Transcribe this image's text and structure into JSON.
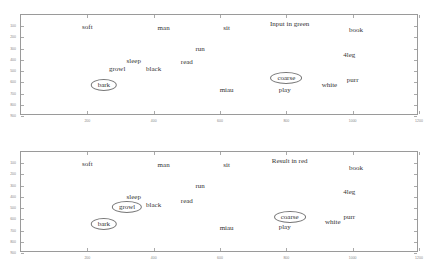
{
  "chart_data": [
    {
      "type": "scatter",
      "title": "Input in green",
      "xlabel": "",
      "ylabel": "",
      "xlim": [
        0,
        1200
      ],
      "ylim": [
        900,
        0
      ],
      "x_ticks": [
        200,
        400,
        600,
        800,
        1000,
        1200
      ],
      "y_ticks": [
        100,
        200,
        300,
        400,
        500,
        600,
        700,
        800,
        900
      ],
      "grid": false,
      "points": [
        {
          "label": "soft",
          "x": 200,
          "y": 110,
          "circled": false
        },
        {
          "label": "man",
          "x": 430,
          "y": 120,
          "circled": false
        },
        {
          "label": "sit",
          "x": 620,
          "y": 120,
          "circled": false
        },
        {
          "label": "book",
          "x": 1010,
          "y": 135,
          "circled": false
        },
        {
          "label": "run",
          "x": 540,
          "y": 300,
          "circled": false
        },
        {
          "label": "4leg",
          "x": 990,
          "y": 355,
          "circled": false
        },
        {
          "label": "sleep",
          "x": 340,
          "y": 410,
          "circled": false
        },
        {
          "label": "read",
          "x": 500,
          "y": 420,
          "circled": false
        },
        {
          "label": "growl",
          "x": 290,
          "y": 480,
          "circled": false
        },
        {
          "label": "black",
          "x": 400,
          "y": 480,
          "circled": false
        },
        {
          "label": "bark",
          "x": 250,
          "y": 620,
          "circled": true
        },
        {
          "label": "coarse",
          "x": 800,
          "y": 560,
          "circled": true
        },
        {
          "label": "purr",
          "x": 1000,
          "y": 575,
          "circled": false
        },
        {
          "label": "white",
          "x": 930,
          "y": 620,
          "circled": false
        },
        {
          "label": "play",
          "x": 795,
          "y": 665,
          "circled": false
        },
        {
          "label": "miau",
          "x": 620,
          "y": 670,
          "circled": false
        }
      ]
    },
    {
      "type": "scatter",
      "title": "Result in red",
      "xlabel": "",
      "ylabel": "",
      "xlim": [
        0,
        1200
      ],
      "ylim": [
        900,
        0
      ],
      "x_ticks": [
        200,
        400,
        600,
        800,
        1000,
        1200
      ],
      "y_ticks": [
        100,
        200,
        300,
        400,
        500,
        600,
        700,
        800,
        900
      ],
      "grid": false,
      "points": [
        {
          "label": "soft",
          "x": 200,
          "y": 110,
          "circled": false
        },
        {
          "label": "man",
          "x": 430,
          "y": 120,
          "circled": false
        },
        {
          "label": "sit",
          "x": 620,
          "y": 120,
          "circled": false
        },
        {
          "label": "book",
          "x": 1010,
          "y": 140,
          "circled": false
        },
        {
          "label": "run",
          "x": 540,
          "y": 300,
          "circled": false
        },
        {
          "label": "4leg",
          "x": 990,
          "y": 355,
          "circled": false
        },
        {
          "label": "sleep",
          "x": 340,
          "y": 400,
          "circled": false
        },
        {
          "label": "read",
          "x": 500,
          "y": 440,
          "circled": false
        },
        {
          "label": "black",
          "x": 400,
          "y": 470,
          "circled": false
        },
        {
          "label": "growl",
          "x": 320,
          "y": 490,
          "circled": true
        },
        {
          "label": "bark",
          "x": 250,
          "y": 640,
          "circled": true
        },
        {
          "label": "coarse",
          "x": 810,
          "y": 580,
          "circled": true
        },
        {
          "label": "purr",
          "x": 990,
          "y": 580,
          "circled": false
        },
        {
          "label": "white",
          "x": 940,
          "y": 620,
          "circled": false
        },
        {
          "label": "play",
          "x": 795,
          "y": 670,
          "circled": false
        },
        {
          "label": "miau",
          "x": 620,
          "y": 680,
          "circled": false
        }
      ]
    }
  ],
  "plots": [
    {
      "title": "Input in green"
    },
    {
      "title": "Result in red"
    }
  ]
}
